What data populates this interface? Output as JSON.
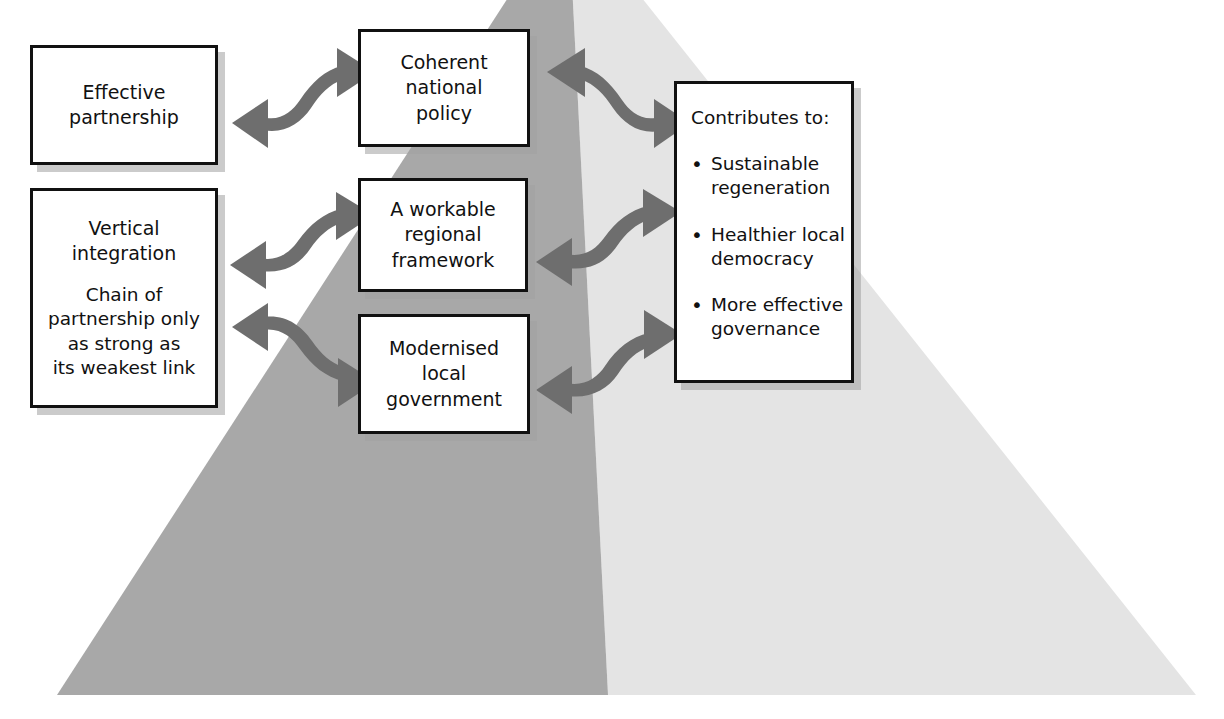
{
  "diagram": {
    "colors": {
      "pyramid_left_face": "#a8a8a8",
      "pyramid_right_face": "#e4e4e4",
      "arrow": "#6e6e6e",
      "box_border": "#111111",
      "box_fill": "#ffffff",
      "box_shadow": "#a0a0a0",
      "text": "#111111",
      "background": "#ffffff"
    },
    "pyramid": {
      "apex_label": "",
      "left_face_name": "dark-left-face",
      "right_face_name": "light-right-face"
    },
    "boxes": {
      "effective_partnership": {
        "lines": [
          "Effective",
          "partnership"
        ]
      },
      "vertical_integration": {
        "heading_lines": [
          "Vertical",
          "integration"
        ],
        "body_lines": [
          "Chain of",
          "partnership only",
          "as strong as",
          "its weakest link"
        ]
      },
      "coherent_national_policy": {
        "lines": [
          "Coherent",
          "national",
          "policy"
        ]
      },
      "workable_regional_framework": {
        "lines": [
          "A workable",
          "regional",
          "framework"
        ]
      },
      "modernised_local_government": {
        "lines": [
          "Modernised",
          "local",
          "government"
        ]
      },
      "contributes_to": {
        "heading": "Contributes to:",
        "items": [
          {
            "lines": [
              "Sustainable",
              "regeneration"
            ]
          },
          {
            "lines": [
              "Healthier local",
              "democracy"
            ]
          },
          {
            "lines": [
              "More effective",
              "governance"
            ]
          }
        ]
      }
    },
    "arrows": [
      {
        "name": "arrow-effective-partnership-coherent-national-policy",
        "style": "double-headed-s-curve"
      },
      {
        "name": "arrow-coherent-national-policy-contributes-to",
        "style": "double-headed-s-curve"
      },
      {
        "name": "arrow-vertical-integration-workable-regional-framework",
        "style": "double-headed-s-curve"
      },
      {
        "name": "arrow-workable-regional-framework-contributes-to",
        "style": "double-headed-s-curve"
      },
      {
        "name": "arrow-vertical-integration-modernised-local-government",
        "style": "double-headed-s-curve"
      },
      {
        "name": "arrow-modernised-local-government-contributes-to",
        "style": "double-headed-s-curve"
      }
    ]
  }
}
